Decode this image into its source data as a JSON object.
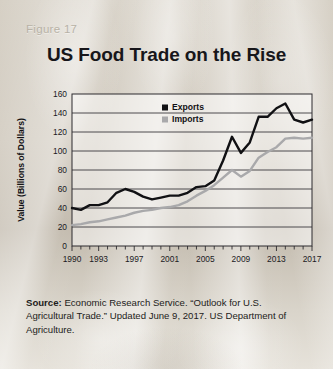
{
  "figure": {
    "label": "Figure 17",
    "title": "US Food Trade on the Rise"
  },
  "source": {
    "label": "Source:",
    "text": " Economic Research Service. “Outlook for U.S. Agricultural Trade.” Updated June 9, 2017. US Department of Agriculture."
  },
  "colors": {
    "exports": "#111114",
    "imports": "#a9a9ab",
    "grid": "#3a393d",
    "axis": "#2c2b2f",
    "figure_label": "#b8b2a6",
    "title": "#17161a"
  },
  "chart_data": {
    "type": "line",
    "title": "US Food Trade on the Rise",
    "xlabel": "",
    "ylabel": "Value (Billions of Dollars)",
    "ylim": [
      0,
      160
    ],
    "ytick_step": 20,
    "yticks": [
      "0",
      "20",
      "40",
      "60",
      "80",
      "100",
      "120",
      "140",
      "160"
    ],
    "xlim": [
      1990,
      2017
    ],
    "xticks": [
      "1990",
      "1993",
      "1997",
      "2001",
      "2005",
      "2009",
      "2013",
      "2017"
    ],
    "xtick_values": [
      1990,
      1993,
      1997,
      2001,
      2005,
      2009,
      2013,
      2017
    ],
    "grid": "horizontal",
    "legend_position": "top-right-inside",
    "x": [
      1990,
      1991,
      1992,
      1993,
      1994,
      1995,
      1996,
      1997,
      1998,
      1999,
      2000,
      2001,
      2002,
      2003,
      2004,
      2005,
      2006,
      2007,
      2008,
      2009,
      2010,
      2011,
      2012,
      2013,
      2014,
      2015,
      2016,
      2017
    ],
    "series": [
      {
        "name": "Exports",
        "color": "#111114",
        "marker": "square",
        "values": [
          40,
          38,
          43,
          43,
          46,
          56,
          60,
          57,
          52,
          49,
          51,
          53,
          53,
          56,
          62,
          63,
          69,
          90,
          115,
          98,
          109,
          136,
          136,
          145,
          150,
          133,
          130,
          133
        ]
      },
      {
        "name": "Imports",
        "color": "#a9a9ab",
        "marker": "square",
        "values": [
          22,
          23,
          25,
          26,
          28,
          30,
          32,
          35,
          37,
          38,
          40,
          41,
          43,
          47,
          53,
          58,
          64,
          72,
          80,
          73,
          79,
          93,
          99,
          104,
          113,
          114,
          113,
          114
        ]
      }
    ]
  }
}
